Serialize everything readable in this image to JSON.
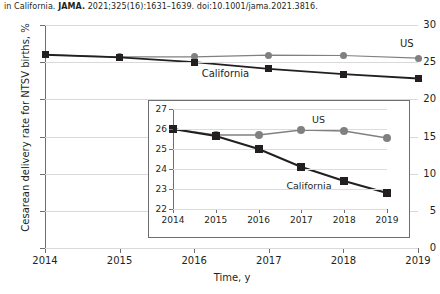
{
  "citation": {
    "prefix": "in California. ",
    "journal": "JAMA.",
    "suffix": " 2021;325(16):1631–1639. doi:10.1001/jama.2021.3816."
  },
  "chart_data": {
    "type": "line",
    "title": "",
    "xlabel": "Time, y",
    "ylabel": "Cesarean delivery rate for NTSV births, %",
    "x": [
      2014,
      2015,
      2016,
      2017,
      2018,
      2019
    ],
    "xticklabels": [
      "2014",
      "2015",
      "2016",
      "2017",
      "2018",
      "2019"
    ],
    "yticklabels": [
      "0",
      "5",
      "10",
      "15",
      "20",
      "25",
      "30"
    ],
    "yticks": [
      0,
      5,
      10,
      15,
      20,
      25,
      30
    ],
    "xlim": [
      2014,
      2019
    ],
    "ylim": [
      0,
      30
    ],
    "grid": true,
    "legend_position": "inline-annotation",
    "series": [
      {
        "name": "US",
        "label": "US",
        "color": "#808080",
        "marker": "circle",
        "values": [
          26.0,
          25.7,
          25.7,
          25.95,
          25.9,
          25.55
        ]
      },
      {
        "name": "California",
        "label": "California",
        "color": "#231f20",
        "marker": "square",
        "values": [
          26.0,
          25.65,
          25.0,
          24.1,
          23.4,
          22.8
        ]
      }
    ],
    "inset": {
      "type": "line",
      "x": [
        2014,
        2015,
        2016,
        2017,
        2018,
        2019
      ],
      "xticklabels": [
        "2014",
        "2015",
        "2016",
        "2017",
        "2018",
        "2019"
      ],
      "yticks": [
        22,
        23,
        24,
        25,
        26,
        27
      ],
      "yticklabels": [
        "22",
        "23",
        "24",
        "25",
        "26",
        "27"
      ],
      "xlim": [
        2014,
        2019
      ],
      "ylim": [
        22,
        27
      ],
      "grid": true,
      "series": [
        {
          "name": "US",
          "label": "US",
          "color": "#808080",
          "marker": "circle",
          "values": [
            26.0,
            25.7,
            25.7,
            25.95,
            25.9,
            25.55
          ]
        },
        {
          "name": "California",
          "label": "California",
          "color": "#231f20",
          "marker": "square",
          "values": [
            26.0,
            25.65,
            25.0,
            24.1,
            23.4,
            22.8
          ]
        }
      ]
    }
  }
}
